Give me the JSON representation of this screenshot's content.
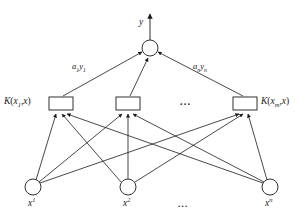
{
  "figure": {
    "type": "neural-network-diagram",
    "background_color": "#ffffff",
    "stroke_color": "#1a1a1a"
  },
  "output": {
    "label": "y",
    "node_name": "summation-node",
    "node_shape": "circle",
    "cx": 150,
    "cy": 48,
    "r": 8,
    "arrow_tip_y": 12
  },
  "weights": [
    {
      "base": "a",
      "sub": "1",
      "var": "y",
      "var_sub": "1",
      "x": 72,
      "y": 66
    },
    {
      "base": "a",
      "sub": "n",
      "var": "y",
      "var_sub": "n",
      "x": 193,
      "y": 66
    }
  ],
  "hidden_layer": {
    "box_width": 24,
    "box_height": 13,
    "box_y": 97,
    "nodes": [
      {
        "cx": 61,
        "label_base": "K",
        "label_arg1": "x",
        "label_sub": "1",
        "label_arg2": "x",
        "label_side": "left"
      },
      {
        "cx": 128,
        "label_base": "",
        "label_arg1": "",
        "label_sub": "",
        "label_arg2": "",
        "label_side": "none"
      },
      {
        "cx": 245,
        "label_base": "K",
        "label_arg1": "x",
        "label_sub": "m",
        "label_arg2": "x",
        "label_side": "right"
      }
    ],
    "ellipsis": {
      "text": "...",
      "x": 186,
      "y": 101
    },
    "left_label": {
      "x": 6,
      "y": 98
    },
    "right_label": {
      "x": 262,
      "y": 98
    }
  },
  "input_layer": {
    "radius": 8,
    "cy": 187,
    "nodes": [
      {
        "cx": 33,
        "base": "x",
        "sup": "1",
        "label_x": 29,
        "label_y": 204
      },
      {
        "cx": 128,
        "base": "x",
        "sup": "2",
        "label_x": 124,
        "label_y": 204
      },
      {
        "cx": 270,
        "base": "x",
        "sup": "n",
        "label_x": 266,
        "label_y": 204
      }
    ],
    "ellipsis": {
      "text": "...",
      "x": 180,
      "y": 200
    }
  },
  "labels": {
    "paren_open": "(",
    "paren_close": ")",
    "comma": ","
  }
}
